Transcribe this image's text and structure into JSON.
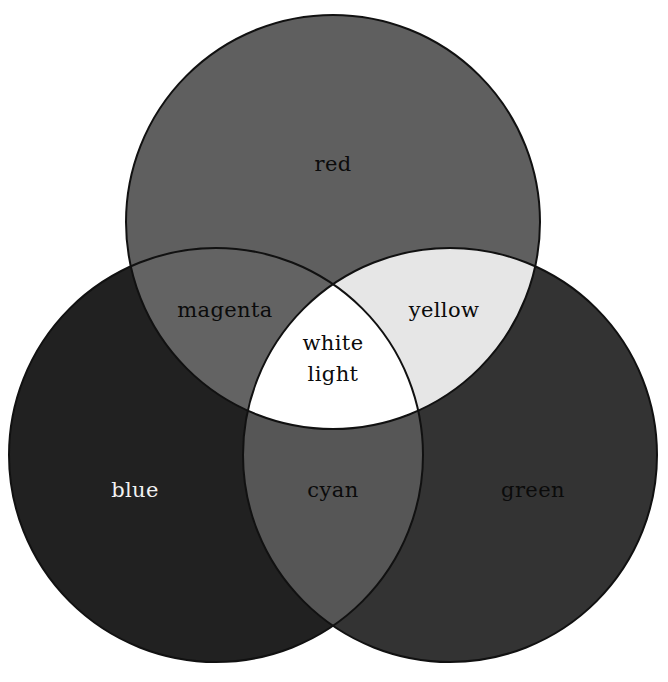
{
  "diagram": {
    "background_color": "#ffffff",
    "outline_color": "#111111",
    "outline_width": 2,
    "canvas": {
      "width": 668,
      "height": 682
    }
  },
  "circles": [
    {
      "name": "red",
      "label": "red",
      "cx": 333,
      "cy": 222,
      "r": 207,
      "fill": "#5f5f5f",
      "label_x": 333,
      "label_y": 165,
      "label_color": "#0b0b0b"
    },
    {
      "name": "blue",
      "label": "blue",
      "cx": 216,
      "cy": 455,
      "r": 207,
      "fill": "#212121",
      "label_x": 135,
      "label_y": 491,
      "label_color": "#f2f2f2"
    },
    {
      "name": "green",
      "label": "green",
      "cx": 450,
      "cy": 455,
      "r": 207,
      "fill": "#333333",
      "label_x": 533,
      "label_y": 491,
      "label_color": "#0b0b0b"
    }
  ],
  "overlaps": [
    {
      "name": "magenta",
      "label": "magenta",
      "of": [
        "red",
        "blue"
      ],
      "fill": "#636363",
      "label_x": 225,
      "label_y": 311,
      "label_color": "#0b0b0b"
    },
    {
      "name": "yellow",
      "label": "yellow",
      "of": [
        "red",
        "green"
      ],
      "fill": "#e6e6e6",
      "label_x": 444,
      "label_y": 311,
      "label_color": "#0b0b0b"
    },
    {
      "name": "cyan",
      "label": "cyan",
      "of": [
        "blue",
        "green"
      ],
      "fill": "#565656",
      "label_x": 333,
      "label_y": 491,
      "label_color": "#0b0b0b"
    }
  ],
  "center": {
    "name": "white-light",
    "label_line1": "white",
    "label_line2": "light",
    "of": [
      "red",
      "blue",
      "green"
    ],
    "fill": "#ffffff",
    "label_x": 333,
    "label_y": 355,
    "label_color": "#0b0b0b"
  },
  "chart_data": {
    "type": "venn",
    "sets": [
      "red",
      "green",
      "blue"
    ],
    "set_fills": {
      "red": "#5f5f5f",
      "green": "#333333",
      "blue": "#212121"
    },
    "pairwise_intersections": [
      {
        "sets": [
          "red",
          "blue"
        ],
        "label": "magenta",
        "fill": "#636363"
      },
      {
        "sets": [
          "red",
          "green"
        ],
        "label": "yellow",
        "fill": "#e6e6e6"
      },
      {
        "sets": [
          "blue",
          "green"
        ],
        "label": "cyan",
        "fill": "#565656"
      }
    ],
    "triple_intersection": {
      "sets": [
        "red",
        "green",
        "blue"
      ],
      "label": "white light",
      "fill": "#ffffff"
    },
    "labels": [
      "red",
      "green",
      "blue",
      "magenta",
      "yellow",
      "cyan",
      "white light"
    ],
    "rendering": "grayscale",
    "background": "#ffffff",
    "legend": "none"
  }
}
